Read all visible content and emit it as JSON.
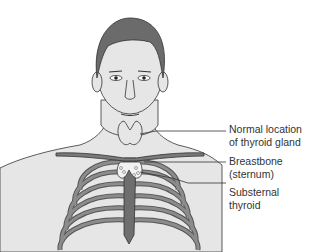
{
  "diagram": {
    "title": "",
    "labels": [
      {
        "id": "normal-location",
        "text": "Normal location\nof thyroid gland"
      },
      {
        "id": "breastbone",
        "text": "Breastbone\n(sternum)"
      },
      {
        "id": "substernal",
        "text": "Substernal\nthyroid"
      }
    ],
    "colors": {
      "skin": "#e6e6e6",
      "hair": "#6b6b6b",
      "ribs": "#7a7a7a",
      "outline": "#333333",
      "leader_line": "#333333"
    }
  }
}
